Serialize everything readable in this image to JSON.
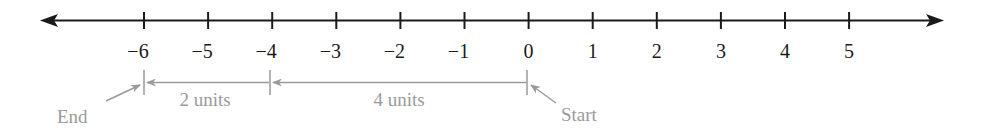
{
  "number_line": {
    "min": -6,
    "max": 5,
    "ticks": [
      {
        "value": -6,
        "label": "−6"
      },
      {
        "value": -5,
        "label": "−5"
      },
      {
        "value": -4,
        "label": "−4"
      },
      {
        "value": -3,
        "label": "−3"
      },
      {
        "value": -2,
        "label": "−2"
      },
      {
        "value": -1,
        "label": "−1"
      },
      {
        "value": 0,
        "label": "0"
      },
      {
        "value": 1,
        "label": "1"
      },
      {
        "value": 2,
        "label": "2"
      },
      {
        "value": 3,
        "label": "3"
      },
      {
        "value": 4,
        "label": "4"
      },
      {
        "value": 5,
        "label": "5"
      }
    ],
    "line_color": "#1a1a1a"
  },
  "annotations": {
    "color": "#9a9a9a",
    "start": {
      "label": "Start",
      "value": 0
    },
    "end": {
      "label": "End",
      "value": -6
    },
    "segments": [
      {
        "from": 0,
        "to": -4,
        "label": "4 units"
      },
      {
        "from": -4,
        "to": -6,
        "label": "2 units"
      }
    ]
  }
}
